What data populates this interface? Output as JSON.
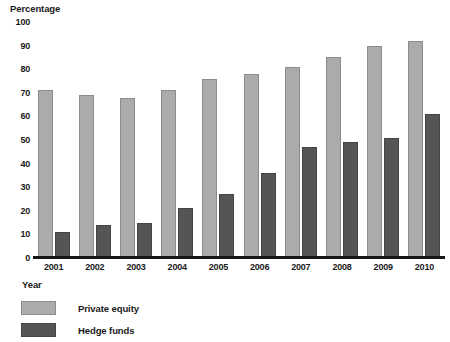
{
  "chart_data": {
    "type": "bar",
    "title": "",
    "subtitle": "",
    "ylabel": "Percentage",
    "xlabel": "Year",
    "ylim": [
      0,
      100
    ],
    "yticks": [
      0,
      10,
      20,
      30,
      40,
      50,
      60,
      70,
      80,
      90,
      100
    ],
    "ytick_labels": [
      "0",
      "10",
      "20",
      "30",
      "40",
      "50",
      "60",
      "70",
      "80",
      "90",
      "100"
    ],
    "grid": false,
    "legend_position": "bottom-left",
    "categories": [
      "2001",
      "2002",
      "2003",
      "2004",
      "2005",
      "2006",
      "2007",
      "2008",
      "2009",
      "2010"
    ],
    "series": [
      {
        "name": "Private equity",
        "color": "#ababab",
        "values": [
          71,
          69,
          68,
          71,
          76,
          78,
          81,
          85,
          90,
          92
        ]
      },
      {
        "name": "Hedge funds",
        "color": "#555555",
        "values": [
          11,
          14,
          15,
          21,
          27,
          36,
          47,
          49,
          51,
          61
        ]
      }
    ],
    "annotations": []
  },
  "legend": {
    "items": [
      {
        "label": "Private equity",
        "swatch": "private-equity-swatch"
      },
      {
        "label": "Hedge funds",
        "swatch": "hedge-funds-swatch"
      }
    ]
  }
}
